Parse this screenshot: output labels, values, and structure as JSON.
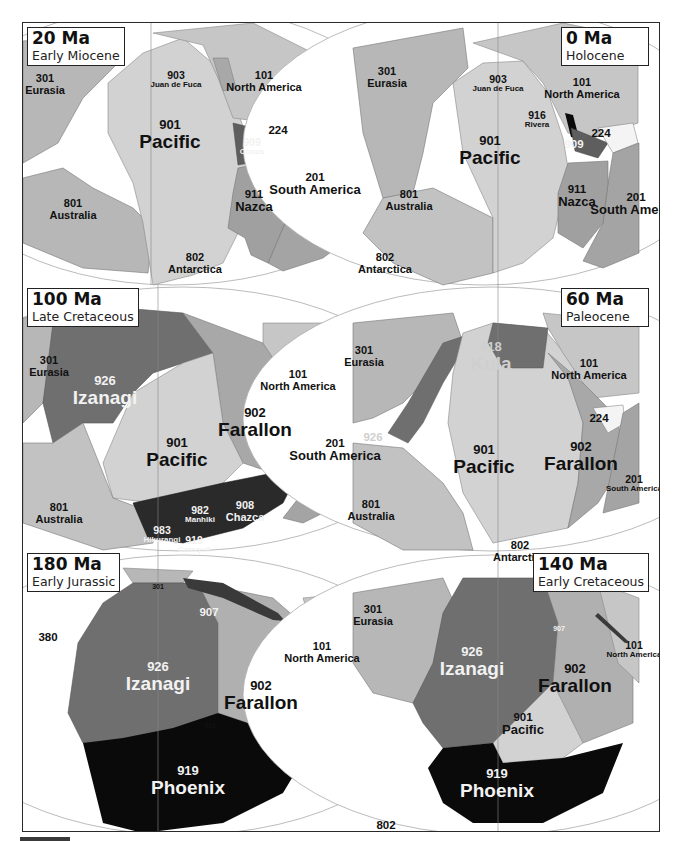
{
  "figure": {
    "colors": {
      "background": "#ffffff",
      "plate_light": "#d2d2d2",
      "plate_mid": "#b7b7b7",
      "plate_dark": "#9e9e9e",
      "plate_darker": "#6f6f6f",
      "plate_darkest": "#3a3a3a",
      "plate_black": "#0a0a0a",
      "ocean_gap": "#f4f4f4",
      "frame": "#2a2a2a"
    },
    "panels": [
      {
        "id": "20ma",
        "age": "20 Ma",
        "epoch": "Early Miocene",
        "box_side": "left",
        "labels": [
          {
            "num": "301",
            "name": "Eurasia",
            "size": "sm",
            "x": 22,
            "y": 62
          },
          {
            "num": "903",
            "name": "Juan de Fuca",
            "size": "xs",
            "x": 153,
            "y": 57
          },
          {
            "num": "101",
            "name": "North America",
            "size": "sm",
            "x": 241,
            "y": 59
          },
          {
            "num": "901",
            "name": "Pacific",
            "size": "big",
            "x": 147,
            "y": 112
          },
          {
            "num": "909",
            "name": "Cocus",
            "size": "xs",
            "x": 229,
            "y": 124,
            "color": "white"
          },
          {
            "num": "224",
            "name": "",
            "size": "num",
            "x": 255,
            "y": 107
          },
          {
            "num": "201",
            "name": "South America",
            "size": "med",
            "x": 292,
            "y": 161
          },
          {
            "num": "911",
            "name": "Nazca",
            "size": "med",
            "x": 231,
            "y": 178
          },
          {
            "num": "801",
            "name": "Australia",
            "size": "sm",
            "x": 50,
            "y": 187
          },
          {
            "num": "802",
            "name": "Antarctica",
            "size": "sm",
            "x": 172,
            "y": 241
          }
        ]
      },
      {
        "id": "0ma",
        "age": "0 Ma",
        "epoch": "Holocene",
        "box_side": "right",
        "labels": [
          {
            "num": "301",
            "name": "Eurasia",
            "size": "sm",
            "x": 45,
            "y": 55
          },
          {
            "num": "903",
            "name": "Juan de Fuca",
            "size": "xs",
            "x": 156,
            "y": 61
          },
          {
            "num": "101",
            "name": "North America",
            "size": "sm",
            "x": 240,
            "y": 66
          },
          {
            "num": "916",
            "name": "Rivera",
            "size": "xs",
            "x": 195,
            "y": 97
          },
          {
            "num": "224",
            "name": "",
            "size": "num",
            "x": 259,
            "y": 110
          },
          {
            "num": "909",
            "name": "",
            "size": "num",
            "x": 232,
            "y": 121,
            "color": "white"
          },
          {
            "num": "901",
            "name": "Pacific",
            "size": "big",
            "x": 148,
            "y": 128
          },
          {
            "num": "911",
            "name": "Nazca",
            "size": "med",
            "x": 235,
            "y": 173
          },
          {
            "num": "201",
            "name": "South America",
            "size": "med",
            "x": 294,
            "y": 181
          },
          {
            "num": "801",
            "name": "Australia",
            "size": "sm",
            "x": 67,
            "y": 178
          },
          {
            "num": "802",
            "name": "Antarctica",
            "size": "sm",
            "x": 43,
            "y": 241
          }
        ]
      },
      {
        "id": "100ma",
        "age": "100 Ma",
        "epoch": "Late Cretaceous",
        "box_side": "left",
        "labels": [
          {
            "num": "301",
            "name": "Eurasia",
            "size": "sm",
            "x": 26,
            "y": 344
          },
          {
            "num": "926",
            "name": "Izanagi",
            "size": "big",
            "x": 82,
            "y": 368,
            "color": "white"
          },
          {
            "num": "101",
            "name": "North America",
            "size": "sm",
            "x": 275,
            "y": 358
          },
          {
            "num": "902",
            "name": "Farallon",
            "size": "big",
            "x": 232,
            "y": 400
          },
          {
            "num": "201",
            "name": "South America",
            "size": "med",
            "x": 312,
            "y": 427
          },
          {
            "num": "901",
            "name": "Pacific",
            "size": "big",
            "x": 154,
            "y": 430
          },
          {
            "num": "801",
            "name": "Australia",
            "size": "sm",
            "x": 36,
            "y": 491
          },
          {
            "num": "982",
            "name": "Manhiki",
            "size": "xs",
            "x": 177,
            "y": 492,
            "color": "white"
          },
          {
            "num": "908",
            "name": "Chazca",
            "size": "sm",
            "x": 222,
            "y": 489,
            "color": "white"
          },
          {
            "num": "983",
            "name": "Hikurangi",
            "size": "xs",
            "x": 139,
            "y": 512,
            "color": "white"
          },
          {
            "num": "919",
            "name": "Cataquil",
            "size": "xs",
            "x": 171,
            "y": 522,
            "color": "white"
          },
          {
            "num": "802",
            "name": "",
            "size": "num",
            "x": 71,
            "y": 540
          }
        ]
      },
      {
        "id": "60ma",
        "age": "60 Ma",
        "epoch": "Paleocene",
        "box_side": "right",
        "labels": [
          {
            "num": "301",
            "name": "Eurasia",
            "size": "sm",
            "x": 22,
            "y": 334
          },
          {
            "num": "918",
            "name": "Kula",
            "size": "big",
            "x": 149,
            "y": 334,
            "color": "grey"
          },
          {
            "num": "101",
            "name": "North America",
            "size": "sm",
            "x": 247,
            "y": 347
          },
          {
            "num": "224",
            "name": "",
            "size": "num",
            "x": 257,
            "y": 395
          },
          {
            "num": "926",
            "name": "",
            "size": "num",
            "x": 31,
            "y": 414,
            "color": "grey"
          },
          {
            "num": "901",
            "name": "Pacific",
            "size": "big",
            "x": 142,
            "y": 437
          },
          {
            "num": "902",
            "name": "Farallon",
            "size": "big",
            "x": 239,
            "y": 434
          },
          {
            "num": "201",
            "name": "South America",
            "size": "xs",
            "x": 292,
            "y": 461
          },
          {
            "num": "801",
            "name": "Australia",
            "size": "sm",
            "x": 29,
            "y": 488
          },
          {
            "num": "802",
            "name": "Antarctica",
            "size": "sm",
            "x": 178,
            "y": 529
          }
        ]
      },
      {
        "id": "180ma",
        "age": "180 Ma",
        "epoch": "Early Jurassic",
        "box_side": "left",
        "labels": [
          {
            "num": "301",
            "name": "",
            "size": "tiny",
            "x": 135,
            "y": 564
          },
          {
            "num": "907",
            "name": "",
            "size": "num",
            "x": 186,
            "y": 589,
            "color": "white"
          },
          {
            "num": "380",
            "name": "",
            "size": "num",
            "x": 25,
            "y": 614
          },
          {
            "num": "101",
            "name": "North America",
            "size": "sm",
            "x": 299,
            "y": 630
          },
          {
            "num": "926",
            "name": "Izanagi",
            "size": "big",
            "x": 135,
            "y": 654,
            "color": "white"
          },
          {
            "num": "902",
            "name": "Farallon",
            "size": "big",
            "x": 238,
            "y": 673
          },
          {
            "num": "901",
            "name": "",
            "size": "tiny",
            "x": 187,
            "y": 703
          },
          {
            "num": "919",
            "name": "Phoenix",
            "size": "big",
            "x": 165,
            "y": 758,
            "color": "white"
          }
        ]
      },
      {
        "id": "140ma",
        "age": "140 Ma",
        "epoch": "Early Cretaceous",
        "box_side": "right",
        "labels": [
          {
            "num": "301",
            "name": "Eurasia",
            "size": "sm",
            "x": 31,
            "y": 593
          },
          {
            "num": "907",
            "name": "",
            "size": "tiny",
            "x": 217,
            "y": 606,
            "color": "white"
          },
          {
            "num": "101",
            "name": "North America",
            "size": "xs",
            "x": 292,
            "y": 627
          },
          {
            "num": "926",
            "name": "Izanagi",
            "size": "big",
            "x": 130,
            "y": 639,
            "color": "white"
          },
          {
            "num": "902",
            "name": "Farallon",
            "size": "big",
            "x": 233,
            "y": 656
          },
          {
            "num": "901",
            "name": "Pacific",
            "size": "med",
            "x": 181,
            "y": 701
          },
          {
            "num": "919",
            "name": "Phoenix",
            "size": "big",
            "x": 155,
            "y": 761,
            "color": "white"
          },
          {
            "num": "802",
            "name": "",
            "size": "num",
            "x": 44,
            "y": 802
          }
        ]
      }
    ]
  }
}
